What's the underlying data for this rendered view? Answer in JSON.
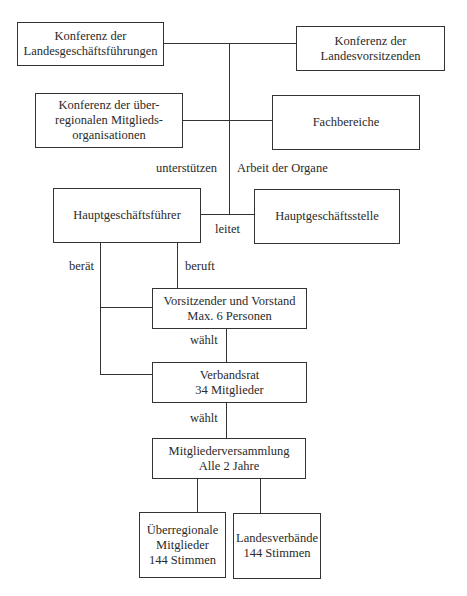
{
  "diagram": {
    "nodes": {
      "landesgeschaeftsfuehrungen": {
        "line1": "Konferenz der",
        "line2": "Landesgeschäftsführungen"
      },
      "landesvorsitzenden": {
        "line1": "Konferenz der",
        "line2": "Landesvorsitzenden"
      },
      "ueberregionale_konferenz": {
        "line1": "Konferenz der über-",
        "line2": "regionalen Mitglieds-",
        "line3": "organisationen"
      },
      "fachbereiche": {
        "line1": "Fachbereiche"
      },
      "hauptgeschaeftsfuehrer": {
        "line1": "Hauptgeschäftsführer"
      },
      "hauptgeschaeftsstelle": {
        "line1": "Hauptgeschäftsstelle"
      },
      "vorstand": {
        "line1": "Vorsitzender und Vorstand",
        "line2": "Max. 6 Personen"
      },
      "verbandsrat": {
        "line1": "Verbandsrat",
        "line2": "34 Mitglieder"
      },
      "mitgliederversammlung": {
        "line1": "Mitgliederversammlung",
        "line2": "Alle 2 Jahre"
      },
      "ueberregionale_mitglieder": {
        "line1": "Überregionale",
        "line2": "Mitglieder",
        "line3": "144 Stimmen"
      },
      "landesverbaende": {
        "line1": "Landesverbände",
        "line2": "144 Stimmen"
      }
    },
    "edge_labels": {
      "unterstuetzen": "unterstützen",
      "arbeit_der_organe": "Arbeit der Organe",
      "leitet": "leitet",
      "beraet": "berät",
      "beruft": "beruft",
      "waehlt_1": "wählt",
      "waehlt_2": "wählt"
    }
  }
}
